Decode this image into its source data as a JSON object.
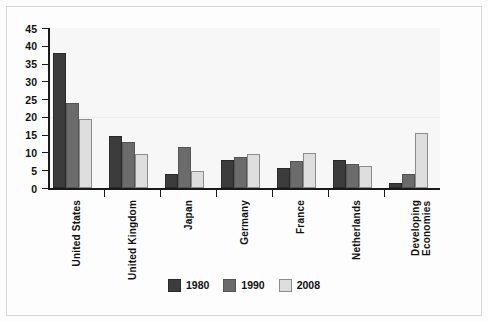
{
  "chart_data": {
    "type": "bar",
    "title": "",
    "subtitle": "",
    "xlabel": "",
    "ylabel": "",
    "ylim": [
      0,
      45
    ],
    "ytick_step": 5,
    "yticks": [
      0,
      5,
      10,
      15,
      20,
      25,
      30,
      35,
      40,
      45
    ],
    "grid": false,
    "legend_position": "bottom-center",
    "categories": [
      "United States",
      "United Kingdom",
      "Japan",
      "Germany",
      "France",
      "Netherlands",
      "Developing\nEconomies"
    ],
    "series": [
      {
        "name": "1980",
        "color": "#3c3c3c",
        "values": [
          38.0,
          14.5,
          4.0,
          8.0,
          5.5,
          8.0,
          1.5
        ]
      },
      {
        "name": "1990",
        "color": "#6b6b6b",
        "values": [
          24.0,
          13.0,
          11.5,
          8.8,
          7.5,
          6.8,
          4.0
        ]
      },
      {
        "name": "2008",
        "color": "#dedede",
        "values": [
          19.5,
          9.5,
          4.7,
          9.7,
          9.8,
          6.3,
          15.5
        ]
      }
    ]
  },
  "legend": {
    "items": [
      {
        "label": "1980"
      },
      {
        "label": "1990"
      },
      {
        "label": "2008"
      }
    ]
  },
  "axes": {
    "y": {
      "ticks": [
        "45",
        "40",
        "35",
        "30",
        "25",
        "20",
        "15",
        "10",
        "5",
        "0"
      ]
    },
    "x": {
      "labels": [
        "United States",
        "United Kingdom",
        "Japan",
        "Germany",
        "France",
        "Netherlands",
        "Developing\nEconomies"
      ]
    }
  },
  "colors": {
    "series_1980": "#3c3c3c",
    "series_1990": "#6b6b6b",
    "series_2008": "#dedede",
    "axis": "#1a1a1a",
    "frame": "#d6d6d6",
    "plot_background": "#f7f7f7"
  }
}
